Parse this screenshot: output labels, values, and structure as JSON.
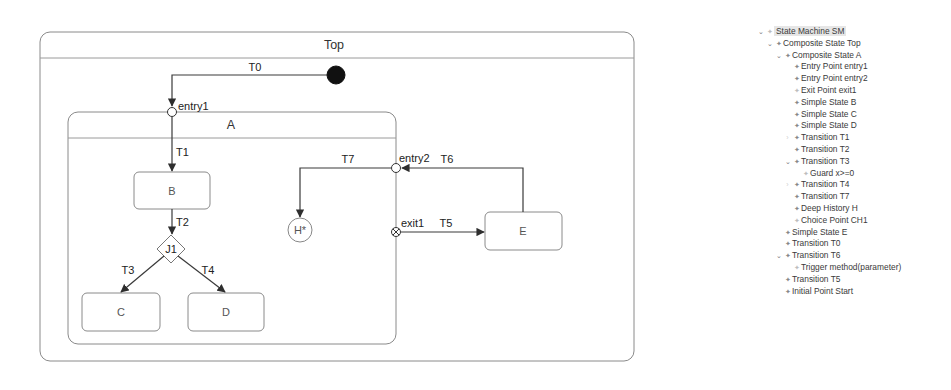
{
  "diagram": {
    "states": {
      "top": {
        "label": "Top"
      },
      "a": {
        "label": "A"
      },
      "b": {
        "label": "B"
      },
      "c": {
        "label": "C"
      },
      "d": {
        "label": "D"
      },
      "e": {
        "label": "E"
      }
    },
    "pseudostates": {
      "entry1": {
        "label": "entry1"
      },
      "entry2": {
        "label": "entry2"
      },
      "exit1": {
        "label": "exit1"
      },
      "junction": {
        "label": "J1"
      },
      "history": {
        "label": "H*"
      }
    },
    "transitions": {
      "t0": "T0",
      "t1": "T1",
      "t2": "T2",
      "t3": "T3",
      "t4": "T4",
      "t5": "T5",
      "t6": "T6",
      "t7": "T7"
    }
  },
  "tree": {
    "items": [
      {
        "label": "State Machine SM",
        "depth": 0,
        "chevron": "expanded",
        "selected": true
      },
      {
        "label": "Composite State Top",
        "depth": 1,
        "chevron": "expanded"
      },
      {
        "label": "Composite State A",
        "depth": 2,
        "chevron": "expanded"
      },
      {
        "label": "Entry Point entry1",
        "depth": 3,
        "chevron": "none"
      },
      {
        "label": "Entry Point entry2",
        "depth": 3,
        "chevron": "none"
      },
      {
        "label": "Exit Point exit1",
        "depth": 3,
        "chevron": "none"
      },
      {
        "label": "Simple State B",
        "depth": 3,
        "chevron": "none"
      },
      {
        "label": "Simple State C",
        "depth": 3,
        "chevron": "none"
      },
      {
        "label": "Simple State D",
        "depth": 3,
        "chevron": "none"
      },
      {
        "label": "Transition T1",
        "depth": 3,
        "chevron": "collapsed"
      },
      {
        "label": "Transition T2",
        "depth": 3,
        "chevron": "none"
      },
      {
        "label": "Transition T3",
        "depth": 3,
        "chevron": "expanded"
      },
      {
        "label": "Guard x>=0",
        "depth": 4,
        "chevron": "none"
      },
      {
        "label": "Transition T4",
        "depth": 3,
        "chevron": "collapsed"
      },
      {
        "label": "Transition T7",
        "depth": 3,
        "chevron": "none"
      },
      {
        "label": "Deep History H",
        "depth": 3,
        "chevron": "none"
      },
      {
        "label": "Choice Point CH1",
        "depth": 3,
        "chevron": "none"
      },
      {
        "label": "Simple State E",
        "depth": 2,
        "chevron": "none"
      },
      {
        "label": "Transition T0",
        "depth": 2,
        "chevron": "none"
      },
      {
        "label": "Transition T6",
        "depth": 2,
        "chevron": "expanded"
      },
      {
        "label": "Trigger method(parameter)",
        "depth": 3,
        "chevron": "none"
      },
      {
        "label": "Transition T5",
        "depth": 2,
        "chevron": "none"
      },
      {
        "label": "Initial Point Start",
        "depth": 2,
        "chevron": "none"
      }
    ]
  },
  "icons": {
    "expanded": "chevron-down-icon",
    "collapsed": "chevron-right-icon",
    "node": "diamond-node-icon"
  }
}
